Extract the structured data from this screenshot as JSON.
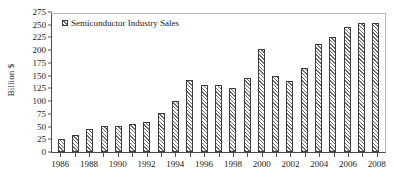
{
  "chart_data": {
    "type": "bar",
    "title": "",
    "xlabel": "",
    "ylabel": "Billion $",
    "ylim": [
      0,
      275
    ],
    "ytick_step": 25,
    "yticks": [
      0,
      25,
      50,
      75,
      100,
      125,
      150,
      175,
      200,
      225,
      250,
      275
    ],
    "grid": false,
    "legend_position": "top-left",
    "legend": [
      "Semiconductor Industry Sales"
    ],
    "series": [
      {
        "name": "Semiconductor Industry Sales",
        "values": [
          26,
          33,
          45,
          51,
          51,
          55,
          60,
          77,
          101,
          142,
          132,
          133,
          127,
          147,
          204,
          150,
          141,
          166,
          213,
          227,
          248,
          256,
          256
        ]
      }
    ],
    "categories": [
      "1986",
      "1987",
      "1988",
      "1989",
      "1990",
      "1991",
      "1992",
      "1993",
      "1994",
      "1995",
      "1996",
      "1997",
      "1998",
      "1999",
      "2000",
      "2001",
      "2002",
      "2003",
      "2004",
      "2005",
      "2006",
      "2007",
      "2008"
    ],
    "xtick_labels": [
      "1986",
      "1988",
      "1990",
      "1992",
      "1994",
      "1996",
      "1998",
      "2000",
      "2002",
      "2004",
      "2006",
      "2008"
    ],
    "colors": {
      "bar_hatch": "#6e6e6e",
      "bar_fill": "#ffffff",
      "bar_edge": "#3d3d3d",
      "axis": "#4a4a4a",
      "text": "#1a1a1a"
    }
  }
}
